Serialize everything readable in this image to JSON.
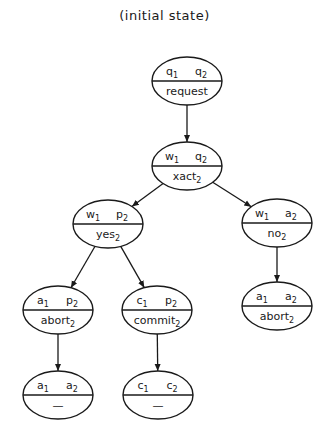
{
  "title": "(initial state)",
  "nodes": [
    {
      "id": "request",
      "top_left": "q",
      "top_left_sub": "1",
      "top_right": "q",
      "top_right_sub": "2",
      "bottom": "request",
      "bottom_sub": "",
      "cx": 187,
      "cy": 81
    },
    {
      "id": "xact",
      "top_left": "w",
      "top_left_sub": "1",
      "top_right": "q",
      "top_right_sub": "2",
      "bottom": "xact",
      "bottom_sub": "2",
      "cx": 187,
      "cy": 166
    },
    {
      "id": "yes",
      "top_left": "w",
      "top_left_sub": "1",
      "top_right": "p",
      "top_right_sub": "2",
      "bottom": "yes",
      "bottom_sub": "2",
      "cx": 108,
      "cy": 224
    },
    {
      "id": "no",
      "top_left": "w",
      "top_left_sub": "1",
      "top_right": "a",
      "top_right_sub": "2",
      "bottom": "no",
      "bottom_sub": "2",
      "cx": 277,
      "cy": 223
    },
    {
      "id": "abort-left",
      "top_left": "a",
      "top_left_sub": "1",
      "top_right": "p",
      "top_right_sub": "2",
      "bottom": "abort",
      "bottom_sub": "2",
      "cx": 58,
      "cy": 310
    },
    {
      "id": "commit",
      "top_left": "c",
      "top_left_sub": "1",
      "top_right": "p",
      "top_right_sub": "2",
      "bottom": "commit",
      "bottom_sub": "2",
      "cx": 157,
      "cy": 310
    },
    {
      "id": "abort-right",
      "top_left": "a",
      "top_left_sub": "1",
      "top_right": "a",
      "top_right_sub": "2",
      "bottom": "abort",
      "bottom_sub": "2",
      "cx": 277,
      "cy": 306
    },
    {
      "id": "final-abort",
      "top_left": "a",
      "top_left_sub": "1",
      "top_right": "a",
      "top_right_sub": "2",
      "bottom": "—",
      "bottom_sub": "",
      "cx": 58,
      "cy": 395
    },
    {
      "id": "final-commit",
      "top_left": "c",
      "top_left_sub": "1",
      "top_right": "c",
      "top_right_sub": "2",
      "bottom": "—",
      "bottom_sub": "",
      "cx": 158,
      "cy": 395
    }
  ],
  "edges": [
    {
      "from": "request",
      "to": "xact"
    },
    {
      "from": "xact",
      "to": "yes"
    },
    {
      "from": "xact",
      "to": "no"
    },
    {
      "from": "yes",
      "to": "abort-left"
    },
    {
      "from": "yes",
      "to": "commit"
    },
    {
      "from": "no",
      "to": "abort-right"
    },
    {
      "from": "abort-left",
      "to": "final-abort"
    },
    {
      "from": "commit",
      "to": "final-commit"
    }
  ]
}
